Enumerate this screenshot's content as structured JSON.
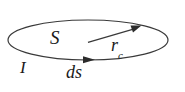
{
  "figure": {
    "background_color": "#ffffff",
    "stroke_color": "#3a3a3a",
    "text_color": "#1a1a1a",
    "labels": {
      "surface": "S",
      "current": "I",
      "line_element": "ds",
      "radius_symbol": "r",
      "radius_subscript": "c"
    },
    "shapes": {
      "loop_name": "ellipse-loop",
      "loop_cx": 88,
      "loop_cy": 40,
      "loop_rx": 80,
      "loop_ry": 20,
      "current_arrow_x": 88,
      "current_arrow_y": 60,
      "radius_arrow_start_x": 88,
      "radius_arrow_start_y": 42,
      "radius_arrow_end_x": 139,
      "radius_arrow_end_y": 27
    }
  }
}
